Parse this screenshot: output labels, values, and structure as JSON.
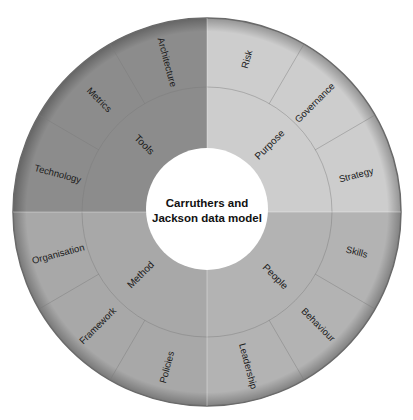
{
  "diagram": {
    "title_line1": "Carruthers and",
    "title_line2": "Jackson data model",
    "colors": {
      "tools": "#8c8c8c",
      "purpose": "#cdcdcd",
      "people": "#b3b3b3",
      "method": "#a8a8a8",
      "divider": "#7a7a7a",
      "rim": "#6a6a6a",
      "center": "#ffffff"
    },
    "quadrants": [
      {
        "name": "Tools",
        "children": [
          "Technology",
          "Metrics",
          "Architecture"
        ]
      },
      {
        "name": "Purpose",
        "children": [
          "Risk",
          "Governance",
          "Strategy"
        ]
      },
      {
        "name": "People",
        "children": [
          "Skills",
          "Behaviour",
          "Leadership"
        ]
      },
      {
        "name": "Method",
        "children": [
          "Policies",
          "Framework",
          "Organisation"
        ]
      }
    ]
  }
}
